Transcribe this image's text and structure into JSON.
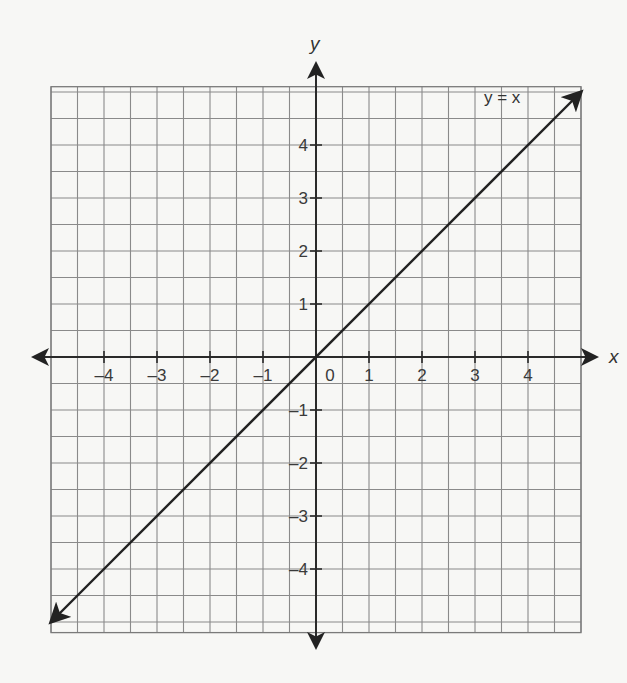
{
  "chart_data": {
    "type": "line",
    "title": "",
    "xlabel": "x",
    "ylabel": "y",
    "xlim": [
      -5,
      5
    ],
    "ylim": [
      -5.2,
      5.1
    ],
    "grid": true,
    "grid_step": 0.5,
    "x_ticks": [
      -4,
      -3,
      -2,
      -1,
      1,
      2,
      3,
      4
    ],
    "x_tick_labels": [
      "–4",
      "–3",
      "–2",
      "–1",
      "1",
      "2",
      "3",
      "4"
    ],
    "y_ticks": [
      4,
      3,
      2,
      1,
      -1,
      -2,
      -3,
      -4
    ],
    "y_tick_labels": [
      "4",
      "3",
      "2",
      "1",
      "–1",
      "–2",
      "–3",
      "–4"
    ],
    "origin_label": "0",
    "series": [
      {
        "name": "y = x",
        "equation": "y = x",
        "x": [
          -5,
          -4,
          -3,
          -2,
          -1,
          0,
          1,
          2,
          3,
          4,
          5
        ],
        "values": [
          -5,
          -4,
          -3,
          -2,
          -1,
          0,
          1,
          2,
          3,
          4,
          5
        ],
        "arrows": "both",
        "color": "#222222"
      }
    ],
    "annotations": [
      {
        "text": "y = x",
        "x": 3.6,
        "y": 4.75
      }
    ],
    "legend": "none"
  }
}
